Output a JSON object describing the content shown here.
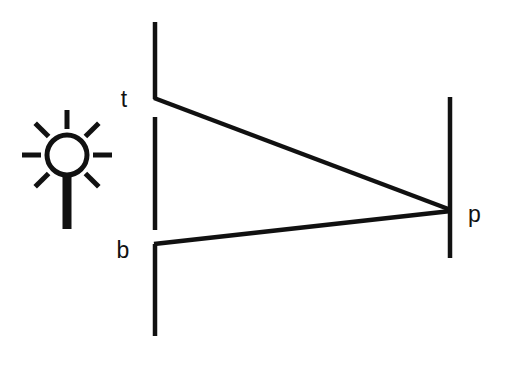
{
  "figure": {
    "kind": "ray-diagram",
    "background_color": "#ffffff",
    "stroke_color": "#111111",
    "canvas": {
      "width": 510,
      "height": 365
    }
  },
  "light_source": {
    "icon_name": "light-source-icon",
    "description": "radiating lamp symbol",
    "circle": {
      "cx": 67,
      "cy": 155,
      "r": 20,
      "stroke_width": 5
    },
    "stem": {
      "x": 67,
      "y_top": 152,
      "y_bottom": 229,
      "width": 9
    },
    "ray_count": 8,
    "ray_inner_radius": 26,
    "ray_outer_radius": 45,
    "ray_stroke_width": 5
  },
  "barrier": {
    "name": "occluding-barrier",
    "x": 155,
    "stroke_width": 4.5,
    "segments": [
      {
        "id": "barrier-top",
        "y_start": 22,
        "y_end": 99
      },
      {
        "id": "barrier-middle",
        "y_start": 117,
        "y_end": 230
      },
      {
        "id": "barrier-bottom",
        "y_start": 244,
        "y_end": 336
      }
    ],
    "apertures": [
      {
        "id": "aperture-t",
        "y_start": 99,
        "y_end": 117
      },
      {
        "id": "aperture-b",
        "y_start": 230,
        "y_end": 244
      }
    ]
  },
  "screen": {
    "name": "projection-screen",
    "x": 450,
    "y_start": 97,
    "y_end": 258,
    "stroke_width": 4.5
  },
  "rays": [
    {
      "id": "ray-t-to-p",
      "from_label": "t",
      "to_label": "p",
      "x1": 155,
      "y1": 98,
      "x2": 450,
      "y2": 210,
      "stroke_width": 4.5
    },
    {
      "id": "ray-b-to-p",
      "from_label": "b",
      "to_label": "p",
      "x1": 155,
      "y1": 244,
      "x2": 450,
      "y2": 211,
      "stroke_width": 4.5
    }
  ],
  "labels": [
    {
      "id": "label-t",
      "text": "t",
      "x": 124,
      "y": 107,
      "anchor": "middle"
    },
    {
      "id": "label-b",
      "text": "b",
      "x": 123,
      "y": 258,
      "anchor": "middle"
    },
    {
      "id": "label-p",
      "text": "p",
      "x": 468,
      "y": 222,
      "anchor": "start"
    }
  ]
}
